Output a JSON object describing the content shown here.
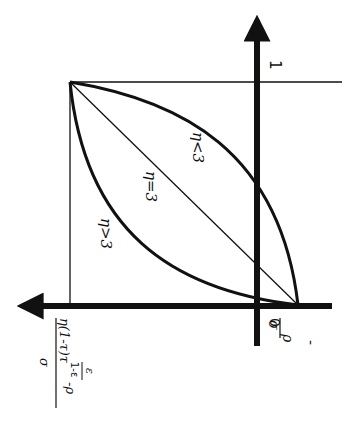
{
  "diagram": {
    "type": "function-curves",
    "orientation": "rotated 90° counter-clockwise",
    "colors": {
      "ink": "#111111",
      "background": "#ffffff"
    },
    "axes": {
      "vertical_axis_top_label": "1",
      "horizontal_axis_labels": {
        "origin": "0",
        "numerator": "ρ",
        "denominator": "σ",
        "sign": "-"
      },
      "left_axis_label": {
        "prefix": "η(1-τ)τ",
        "exponent_num": "ε",
        "exponent_den": "1-ε",
        "suffix": " -ρ",
        "denominator": "σ"
      }
    },
    "curves": [
      {
        "label": "η<3",
        "style": "thick",
        "shape": "concave, upper"
      },
      {
        "label": "η=3",
        "style": "thin",
        "shape": "straight line"
      },
      {
        "label": "η>3",
        "style": "thick",
        "shape": "convex, lower"
      }
    ]
  }
}
